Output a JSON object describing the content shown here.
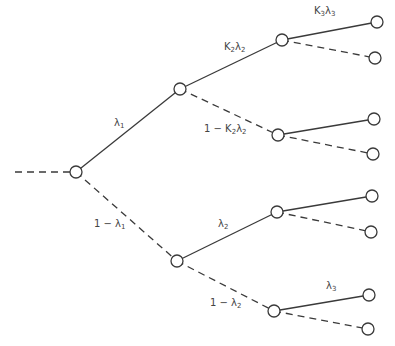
{
  "diagram": {
    "type": "probability-tree",
    "line_color": "#3a3a3a",
    "nodes": [
      {
        "id": "root",
        "x": 76,
        "y": 172
      },
      {
        "id": "n1",
        "x": 180,
        "y": 89
      },
      {
        "id": "n2",
        "x": 177,
        "y": 261
      },
      {
        "id": "n11",
        "x": 282,
        "y": 40
      },
      {
        "id": "n12",
        "x": 278,
        "y": 135
      },
      {
        "id": "n21",
        "x": 277,
        "y": 212
      },
      {
        "id": "n22",
        "x": 274,
        "y": 311
      },
      {
        "id": "l111",
        "x": 377,
        "y": 22
      },
      {
        "id": "l112",
        "x": 375,
        "y": 58
      },
      {
        "id": "l121",
        "x": 374,
        "y": 119
      },
      {
        "id": "l122",
        "x": 373,
        "y": 154
      },
      {
        "id": "l211",
        "x": 372,
        "y": 196
      },
      {
        "id": "l212",
        "x": 371,
        "y": 232
      },
      {
        "id": "l221",
        "x": 369,
        "y": 295
      },
      {
        "id": "l222",
        "x": 368,
        "y": 329
      }
    ],
    "edges": [
      {
        "from": "entry",
        "to": "root",
        "style": "dashed"
      },
      {
        "from": "root",
        "to": "n1",
        "style": "solid"
      },
      {
        "from": "root",
        "to": "n2",
        "style": "dashed"
      },
      {
        "from": "n1",
        "to": "n11",
        "style": "solid"
      },
      {
        "from": "n1",
        "to": "n12",
        "style": "dashed"
      },
      {
        "from": "n2",
        "to": "n21",
        "style": "solid"
      },
      {
        "from": "n2",
        "to": "n22",
        "style": "dashed"
      },
      {
        "from": "n11",
        "to": "l111",
        "style": "solid"
      },
      {
        "from": "n11",
        "to": "l112",
        "style": "dashed"
      },
      {
        "from": "n12",
        "to": "l121",
        "style": "solid"
      },
      {
        "from": "n12",
        "to": "l122",
        "style": "dashed"
      },
      {
        "from": "n21",
        "to": "l211",
        "style": "solid"
      },
      {
        "from": "n21",
        "to": "l212",
        "style": "dashed"
      },
      {
        "from": "n22",
        "to": "l221",
        "style": "solid"
      },
      {
        "from": "n22",
        "to": "l222",
        "style": "dashed"
      }
    ],
    "labels": {
      "lambda1": {
        "main": "λ",
        "sub": "1",
        "prefix": ""
      },
      "one_minus_lambda1": {
        "main": "λ",
        "sub": "1",
        "prefix": "1 − "
      },
      "k2_lambda2": {
        "main": "K",
        "sub": "2",
        "main2": "λ",
        "sub2": "2",
        "prefix": ""
      },
      "one_minus_k2_lambda2": {
        "main": "K",
        "sub": "2",
        "main2": "λ",
        "sub2": "2",
        "prefix": "1 − "
      },
      "k3_lambda3": {
        "main": "K",
        "sub": "3",
        "main2": "λ",
        "sub2": "3",
        "prefix": ""
      },
      "lambda2": {
        "main": "λ",
        "sub": "2",
        "prefix": ""
      },
      "one_minus_lambda2": {
        "main": "λ",
        "sub": "2",
        "prefix": "1 − "
      },
      "lambda3": {
        "main": "λ",
        "sub": "3",
        "prefix": ""
      }
    }
  }
}
